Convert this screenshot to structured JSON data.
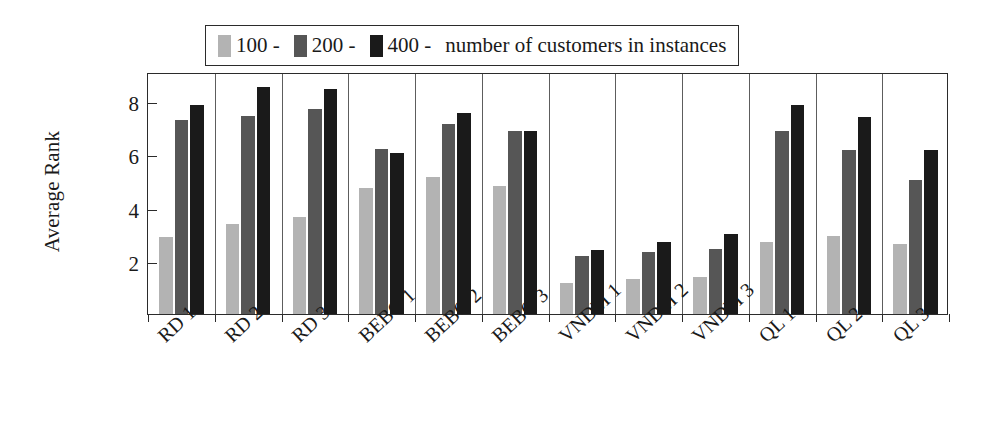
{
  "chart_data": {
    "type": "bar",
    "title": "",
    "xlabel": "",
    "ylabel": "Average Rank",
    "categories": [
      "RD 1",
      "RD 2",
      "RD 3",
      "BEBO 1",
      "BEBO 2",
      "BEBO 3",
      "VNDM 1",
      "VNDM 2",
      "VNDM 3",
      "QL 1",
      "QL 2",
      "QL 3"
    ],
    "series": [
      {
        "name": "100",
        "color": "#b3b3b3",
        "values": [
          2.9,
          3.4,
          3.65,
          4.75,
          5.15,
          4.8,
          1.15,
          1.3,
          1.4,
          2.7,
          2.95,
          2.65
        ]
      },
      {
        "name": "200",
        "color": "#565656",
        "values": [
          7.3,
          7.45,
          7.7,
          6.2,
          7.15,
          6.9,
          2.2,
          2.35,
          2.45,
          6.9,
          6.15,
          5.05
        ]
      },
      {
        "name": "400",
        "color": "#1a1a1a",
        "values": [
          7.85,
          8.55,
          8.45,
          6.05,
          7.55,
          6.9,
          2.4,
          2.7,
          3.0,
          7.85,
          7.4,
          6.15
        ]
      }
    ],
    "ylim": [
      0,
      9.1
    ],
    "yticks": [
      2,
      4,
      6,
      8
    ],
    "ytick_labels": [
      "2",
      "4",
      "6",
      "8"
    ],
    "grid": false,
    "legend_position": "top",
    "legend_suffix": "number of customers in instances",
    "legend_separator": "-"
  },
  "legend": {
    "entries": [
      {
        "label": "100",
        "dash": "-",
        "color": "#b3b3b3"
      },
      {
        "label": "200",
        "dash": "-",
        "color": "#565656"
      },
      {
        "label": "400",
        "dash": "-",
        "color": "#1a1a1a"
      }
    ],
    "tail": "number of customers in instances"
  },
  "axes": {
    "y_title": "Average Rank"
  }
}
